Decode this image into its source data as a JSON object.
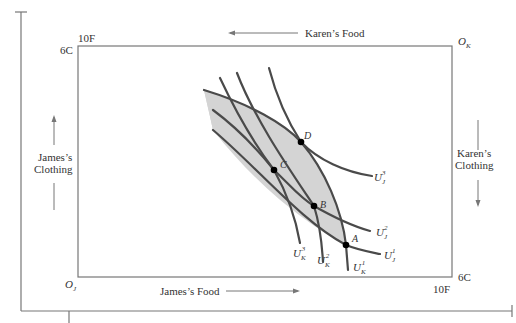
{
  "diagram": {
    "type": "edgeworth-box",
    "origins": {
      "james": {
        "label": "O",
        "sub": "J"
      },
      "karen": {
        "label": "O",
        "sub": "K"
      }
    },
    "axis_labels": {
      "top": "Karen’s Food",
      "bottom": "James’s Food",
      "left_line1": "James’s",
      "left_line2": "Clothing",
      "right_line1": "Karen’s",
      "right_line2": "Clothing"
    },
    "corner_labels": {
      "top_left_food": "10F",
      "top_left_clothing": "6C",
      "bottom_right_clothing": "6C",
      "bottom_right_food": "10F"
    },
    "points": [
      {
        "name": "A"
      },
      {
        "name": "B"
      },
      {
        "name": "C"
      },
      {
        "name": "D"
      }
    ],
    "curves": [
      {
        "id": "UJ1",
        "base": "U",
        "sub": "J",
        "sup": "1"
      },
      {
        "id": "UJ2",
        "base": "U",
        "sub": "J",
        "sup": "2"
      },
      {
        "id": "UJ3",
        "base": "U",
        "sub": "J",
        "sup": "3"
      },
      {
        "id": "UK1",
        "base": "U",
        "sub": "K",
        "sup": "1"
      },
      {
        "id": "UK2",
        "base": "U",
        "sub": "K",
        "sup": "2"
      },
      {
        "id": "UK3",
        "base": "U",
        "sub": "K",
        "sup": "3"
      }
    ],
    "colors": {
      "curve": "#4a4a4a",
      "lens_fill": "#d4d4d4",
      "frame": "#777777",
      "point": "#000000"
    }
  }
}
